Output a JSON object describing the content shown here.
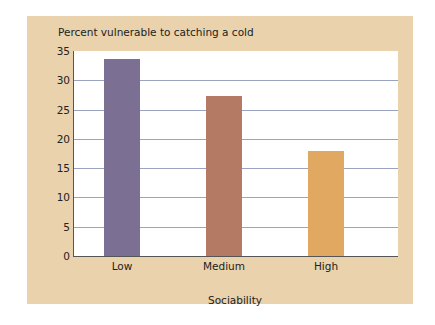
{
  "chart_data": {
    "type": "bar",
    "title": "Percent vulnerable to catching a cold",
    "xlabel": "Sociability",
    "ylabel": "Percent vulnerable to catching a cold",
    "categories": [
      "Low",
      "Medium",
      "High"
    ],
    "values": [
      33.6,
      27.3,
      17.9
    ],
    "colors": [
      "#7b6f93",
      "#b57a63",
      "#e0a860"
    ],
    "ylim": [
      0,
      35
    ],
    "yticks": [
      0,
      5,
      10,
      15,
      20,
      25,
      30,
      35
    ],
    "grid": true,
    "legend": null
  },
  "labels": {
    "title": "Percent vulnerable to catching a cold",
    "xlabel": "Sociability",
    "yticks": [
      "0",
      "5",
      "10",
      "15",
      "20",
      "25",
      "30",
      "35"
    ],
    "categories": [
      "Low",
      "Medium",
      "High"
    ]
  }
}
